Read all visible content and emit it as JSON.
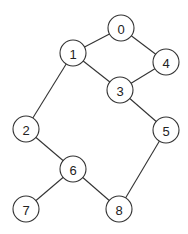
{
  "graph": {
    "nodes": [
      {
        "id": "0",
        "label": "0",
        "x": 121,
        "y": 28
      },
      {
        "id": "1",
        "label": "1",
        "x": 73,
        "y": 53
      },
      {
        "id": "4",
        "label": "4",
        "x": 166,
        "y": 62
      },
      {
        "id": "3",
        "label": "3",
        "x": 120,
        "y": 90
      },
      {
        "id": "2",
        "label": "2",
        "x": 26,
        "y": 129
      },
      {
        "id": "5",
        "label": "5",
        "x": 166,
        "y": 130
      },
      {
        "id": "6",
        "label": "6",
        "x": 73,
        "y": 169
      },
      {
        "id": "7",
        "label": "7",
        "x": 26,
        "y": 209
      },
      {
        "id": "8",
        "label": "8",
        "x": 119,
        "y": 209
      }
    ],
    "edges": [
      [
        "0",
        "1"
      ],
      [
        "0",
        "4"
      ],
      [
        "1",
        "3"
      ],
      [
        "4",
        "3"
      ],
      [
        "1",
        "2"
      ],
      [
        "3",
        "5"
      ],
      [
        "2",
        "6"
      ],
      [
        "6",
        "7"
      ],
      [
        "6",
        "8"
      ],
      [
        "5",
        "8"
      ]
    ],
    "node_radius": 13
  }
}
